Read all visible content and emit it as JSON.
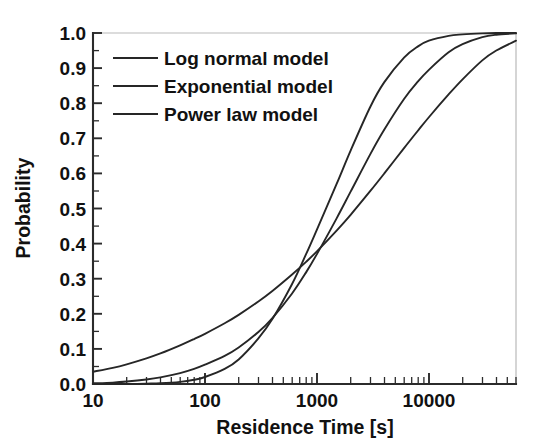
{
  "chart_data": {
    "type": "line",
    "title": "",
    "xlabel": "Residence Time [s]",
    "ylabel": "Probability",
    "xscale": "log",
    "yscale": "linear",
    "xlim": [
      10,
      60000
    ],
    "ylim": [
      0.0,
      1.0
    ],
    "grid": false,
    "legend_position": "upper left",
    "xticks": [
      10,
      100,
      1000,
      10000
    ],
    "xtick_labels": [
      "10",
      "100",
      "1000",
      "10000"
    ],
    "yticks": [
      0.0,
      0.1,
      0.2,
      0.3,
      0.4,
      0.5,
      0.6,
      0.7,
      0.8,
      0.9,
      1.0
    ],
    "ytick_labels": [
      "0.0",
      "0.1",
      "0.2",
      "0.3",
      "0.4",
      "0.5",
      "0.6",
      "0.7",
      "0.8",
      "0.9",
      "1.0"
    ],
    "x": [
      10,
      15,
      20,
      30,
      40,
      60,
      80,
      100,
      150,
      200,
      300,
      400,
      600,
      800,
      1000,
      1500,
      2000,
      3000,
      4000,
      6000,
      8000,
      10000,
      15000,
      20000,
      30000,
      40000,
      60000
    ],
    "series": [
      {
        "name": "Log normal model",
        "color": "#262626",
        "values": [
          0.0,
          0.0,
          0.0,
          0.001,
          0.002,
          0.006,
          0.012,
          0.02,
          0.043,
          0.07,
          0.13,
          0.185,
          0.285,
          0.37,
          0.44,
          0.57,
          0.665,
          0.79,
          0.86,
          0.93,
          0.962,
          0.978,
          0.992,
          0.996,
          0.999,
          1.0,
          1.0
        ]
      },
      {
        "name": "Exponential model",
        "color": "#262626",
        "values": [
          0.002,
          0.004,
          0.007,
          0.013,
          0.019,
          0.031,
          0.043,
          0.055,
          0.08,
          0.104,
          0.148,
          0.188,
          0.258,
          0.318,
          0.37,
          0.472,
          0.548,
          0.655,
          0.725,
          0.812,
          0.862,
          0.895,
          0.945,
          0.968,
          0.988,
          0.995,
          0.999
        ]
      },
      {
        "name": "Power law model",
        "color": "#262626",
        "values": [
          0.035,
          0.046,
          0.056,
          0.073,
          0.087,
          0.11,
          0.128,
          0.143,
          0.173,
          0.197,
          0.235,
          0.265,
          0.312,
          0.348,
          0.378,
          0.437,
          0.482,
          0.55,
          0.6,
          0.672,
          0.722,
          0.76,
          0.825,
          0.868,
          0.922,
          0.95,
          0.978
        ]
      }
    ]
  },
  "axes": {
    "x_axis_label": "Residence Time [s]",
    "y_axis_label": "Probability",
    "x_tick_10": "10",
    "x_tick_100": "100",
    "x_tick_1000": "1000",
    "x_tick_10000": "10000",
    "y_tick_00": "0.0",
    "y_tick_01": "0.1",
    "y_tick_02": "0.2",
    "y_tick_03": "0.3",
    "y_tick_04": "0.4",
    "y_tick_05": "0.5",
    "y_tick_06": "0.6",
    "y_tick_07": "0.7",
    "y_tick_08": "0.8",
    "y_tick_09": "0.9",
    "y_tick_10": "1.0"
  },
  "legend": {
    "items": [
      {
        "label": "Log normal model"
      },
      {
        "label": "Exponential model"
      },
      {
        "label": "Power law model"
      }
    ]
  }
}
